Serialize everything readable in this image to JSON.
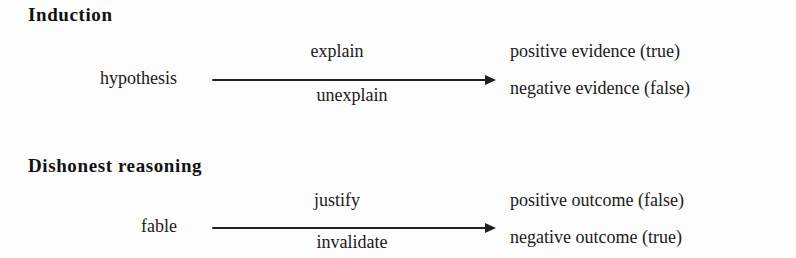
{
  "figure": {
    "background_color": "#fdfdfd",
    "ink_color": "#1a1a1a",
    "sections": [
      {
        "heading": "Induction",
        "source": "hypothesis",
        "edge_top": "explain",
        "edge_bottom": "unexplain",
        "target_top": "positive evidence (true)",
        "target_bottom": "negative evidence (false)"
      },
      {
        "heading": "Dishonest reasoning",
        "source": "fable",
        "edge_top": "justify",
        "edge_bottom": "invalidate",
        "target_top": "positive outcome (false)",
        "target_bottom": "negative outcome (true)"
      }
    ]
  }
}
